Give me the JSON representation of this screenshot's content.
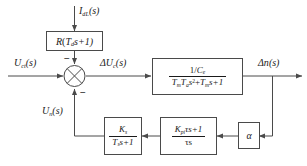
{
  "diagram": {
    "stroke_color": "#4a4a4a",
    "text_color": "#1a1a1a",
    "background": "#ffffff"
  },
  "signals": {
    "disturbance_input": "I",
    "disturbance_sub": "dL",
    "disturbance_arg": "(s)",
    "reference_input": "U",
    "reference_sub": "ct",
    "reference_arg": "(s)",
    "control_signal": "ΔU",
    "control_sub": "c",
    "control_arg": "(s)",
    "output": "Δn",
    "output_arg": "(s)",
    "feedback_voltage": "U",
    "feedback_sub": "n",
    "feedback_arg": "(s)"
  },
  "summing_junction": {
    "name": "summing-junction",
    "sign_top": "−",
    "sign_bottom": "−"
  },
  "blocks": {
    "disturbance_gain": {
      "label": "R",
      "expr_open": "(",
      "expr_var": "T",
      "expr_sub": "d",
      "expr_tail": "s+1)"
    },
    "plant": {
      "numerator_prefix": "1/",
      "numerator_var": "C",
      "numerator_sub": "e",
      "den_t1": "T",
      "den_t1_sub": "m",
      "den_t2": "T",
      "den_t2_sub": "a",
      "den_s2": "s",
      "den_s2_sup": "2",
      "den_plus1": "+",
      "den_t3": "T",
      "den_t3_sub": "m",
      "den_s": "s+1"
    },
    "filter": {
      "num_var": "K",
      "num_sub": "s",
      "den_var": "T",
      "den_sub": "s",
      "den_tail": "s+1"
    },
    "pi_controller": {
      "num_var": "K",
      "num_sub": "pi",
      "num_tail": "τs+1",
      "den": "τs"
    },
    "alpha_gain": {
      "label": "α"
    }
  }
}
